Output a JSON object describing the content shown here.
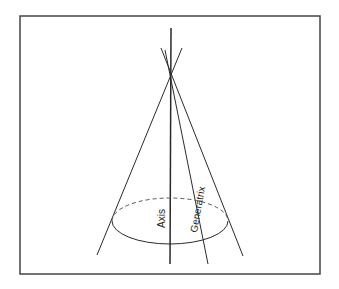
{
  "diagram": {
    "type": "cone",
    "labels": {
      "axis": "Axis",
      "generatrix": "Generatrix"
    },
    "colors": {
      "stroke": "#2a2a2a",
      "frame": "#444444",
      "background": "#ffffff"
    }
  }
}
